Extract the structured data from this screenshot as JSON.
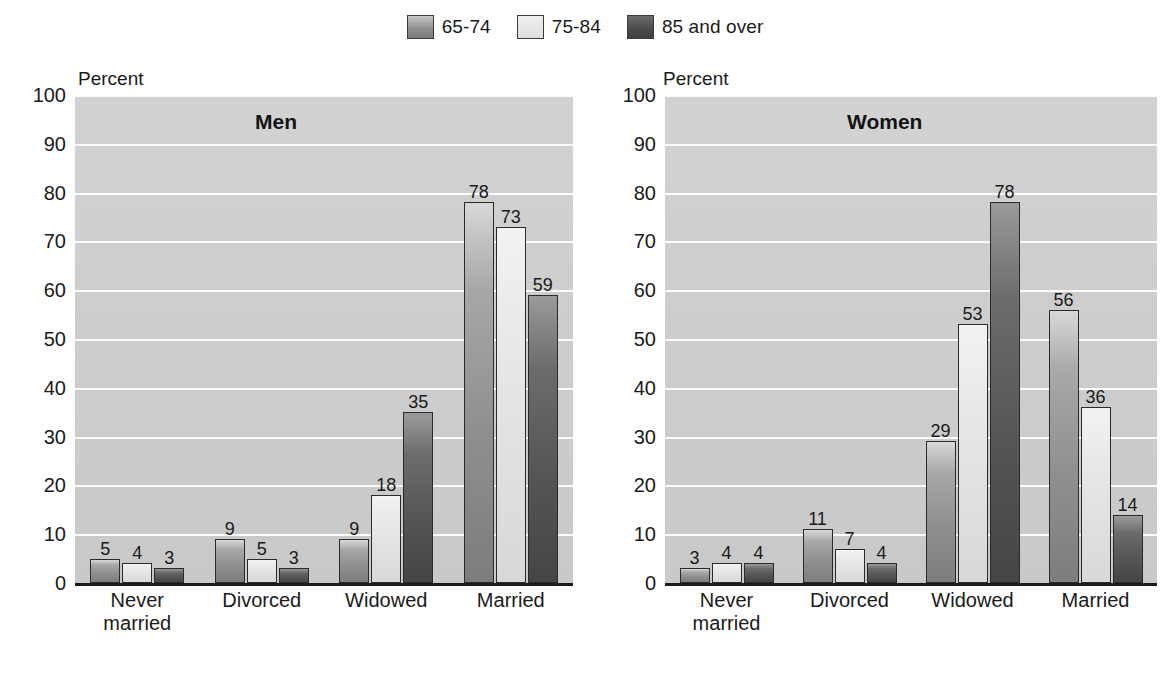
{
  "legend": {
    "entries": [
      {
        "label": "65-74",
        "color": "#8f8f8f"
      },
      {
        "label": "75-84",
        "color": "#e6e6e6"
      },
      {
        "label": "85 and over",
        "color": "#545454"
      }
    ]
  },
  "axis": {
    "ylabel": "Percent",
    "yticks": [
      "100",
      "90",
      "80",
      "70",
      "60",
      "50",
      "40",
      "30",
      "20",
      "10",
      "0"
    ]
  },
  "panels": [
    {
      "title": "Men"
    },
    {
      "title": "Women"
    }
  ],
  "chart_data": [
    {
      "type": "bar",
      "title": "Men",
      "xlabel": "",
      "ylabel": "Percent",
      "ylim": [
        0,
        100
      ],
      "grid": true,
      "legend_position": "top-center",
      "categories": [
        "Never\nmarried",
        "Divorced",
        "Widowed",
        "Married"
      ],
      "series": [
        {
          "name": "65-74",
          "values": [
            5,
            9,
            9,
            78
          ]
        },
        {
          "name": "75-84",
          "values": [
            4,
            5,
            18,
            73
          ]
        },
        {
          "name": "85 and over",
          "values": [
            3,
            3,
            35,
            59
          ]
        }
      ]
    },
    {
      "type": "bar",
      "title": "Women",
      "xlabel": "",
      "ylabel": "Percent",
      "ylim": [
        0,
        100
      ],
      "grid": true,
      "legend_position": "top-center",
      "categories": [
        "Never\nmarried",
        "Divorced",
        "Widowed",
        "Married"
      ],
      "series": [
        {
          "name": "65-74",
          "values": [
            3,
            11,
            29,
            56
          ]
        },
        {
          "name": "75-84",
          "values": [
            4,
            7,
            53,
            36
          ]
        },
        {
          "name": "85 and over",
          "values": [
            4,
            4,
            78,
            14
          ]
        }
      ]
    }
  ]
}
